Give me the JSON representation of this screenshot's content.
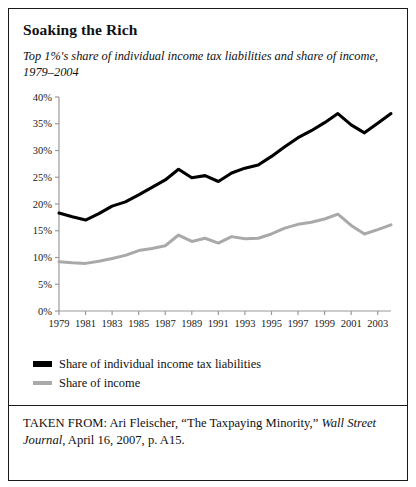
{
  "figure": {
    "title": "Soaking the Rich",
    "subtitle": "Top 1%'s share of individual income tax liabilities and share of income, 1979–2004",
    "source_prefix": "TAKEN FROM: Ari Fleischer, “The Taxpaying Minority,” ",
    "source_italic_1": "Wall Street Journal",
    "source_suffix": ", April 16, 2007, p. A15."
  },
  "legend": {
    "items": [
      {
        "label": "Share of individual income tax liabilities",
        "color": "#000000"
      },
      {
        "label": "Share of income",
        "color": "#a9a9a9"
      }
    ]
  },
  "chart_data": {
    "type": "line",
    "title": "Soaking the Rich",
    "subtitle": "Top 1%'s share of individual income tax liabilities and share of income, 1979–2004",
    "xlabel": "",
    "ylabel": "",
    "x": [
      1979,
      1980,
      1981,
      1982,
      1983,
      1984,
      1985,
      1986,
      1987,
      1988,
      1989,
      1990,
      1991,
      1992,
      1993,
      1994,
      1995,
      1996,
      1997,
      1998,
      1999,
      2000,
      2001,
      2002,
      2003,
      2004
    ],
    "xticks": [
      1979,
      1981,
      1983,
      1985,
      1987,
      1989,
      1991,
      1993,
      1995,
      1997,
      1999,
      2001,
      2003
    ],
    "xtick_labels": [
      "1979",
      "1981",
      "1983",
      "1985",
      "1987",
      "1989",
      "1991",
      "1993",
      "1995",
      "1997",
      "1999",
      "2001",
      "2003"
    ],
    "yticks": [
      0,
      5,
      10,
      15,
      20,
      25,
      30,
      35,
      40
    ],
    "ytick_labels": [
      "0%",
      "5%",
      "10%",
      "15%",
      "20%",
      "25%",
      "30%",
      "35%",
      "40%"
    ],
    "ylim": [
      0,
      40
    ],
    "xlim": [
      1979,
      2004
    ],
    "grid": false,
    "legend_position": "below",
    "series": [
      {
        "name": "Share of individual income tax liabilities",
        "color": "#000000",
        "values": [
          18.3,
          17.6,
          17.0,
          18.2,
          19.6,
          20.4,
          21.7,
          23.1,
          24.5,
          26.5,
          24.9,
          25.3,
          24.2,
          25.8,
          26.7,
          27.3,
          28.9,
          30.7,
          32.4,
          33.7,
          35.2,
          36.9,
          34.8,
          33.3,
          35.1,
          36.9
        ]
      },
      {
        "name": "Share of income",
        "color": "#a9a9a9",
        "values": [
          9.2,
          9.0,
          8.9,
          9.3,
          9.8,
          10.4,
          11.3,
          11.7,
          12.2,
          14.2,
          13.0,
          13.6,
          12.7,
          13.9,
          13.5,
          13.6,
          14.4,
          15.5,
          16.2,
          16.6,
          17.2,
          18.1,
          16.0,
          14.4,
          15.2,
          16.1
        ]
      }
    ]
  }
}
